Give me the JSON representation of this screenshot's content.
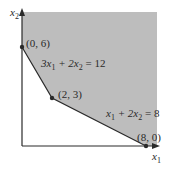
{
  "diagram": {
    "type": "feasible-region",
    "axes": {
      "x_label": "x",
      "x_sub": "1",
      "y_label": "x",
      "y_sub": "2"
    },
    "vertices": [
      {
        "label": "(0, 6)",
        "x": 0,
        "y": 6
      },
      {
        "label": "(2, 3)",
        "x": 2,
        "y": 3
      },
      {
        "label": "(8, 0)",
        "x": 8,
        "y": 0
      }
    ],
    "constraints": [
      {
        "a": "3x",
        "a_sub": "1",
        "b": " + 2x",
        "b_sub": "2",
        "rhs": " = 12"
      },
      {
        "a": "x",
        "a_sub": "1",
        "b": " + 2x",
        "b_sub": "2",
        "rhs": " = 8"
      }
    ],
    "colors": {
      "region": "#bdbdbd",
      "axis": "#2a2a2a",
      "boundary": "#2a2a2a"
    }
  }
}
